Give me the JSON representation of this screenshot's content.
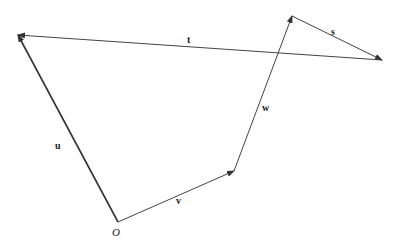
{
  "diagram": {
    "origin_label": "O",
    "vectors": [
      {
        "name": "u",
        "label": "u",
        "from": [
          118,
          222
        ],
        "to": [
          18,
          35
        ],
        "stroke_width": 1.6
      },
      {
        "name": "v",
        "label": "v",
        "from": [
          118,
          222
        ],
        "to": [
          234,
          171
        ],
        "stroke_width": 1
      },
      {
        "name": "w",
        "label": "w",
        "from": [
          234,
          171
        ],
        "to": [
          292,
          16
        ],
        "stroke_width": 1
      },
      {
        "name": "s",
        "label": "s",
        "from": [
          292,
          16
        ],
        "to": [
          382,
          60
        ],
        "stroke_width": 1
      },
      {
        "name": "t",
        "label": "t",
        "from": [
          382,
          60
        ],
        "to": [
          18,
          35
        ],
        "stroke_width": 1
      }
    ],
    "colors": {
      "line": "#333333",
      "background": "#ffffff"
    }
  }
}
